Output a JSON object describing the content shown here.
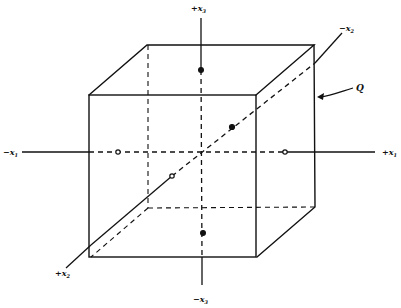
{
  "diagram": {
    "type": "cube-with-axes",
    "stroke_color": "#111111",
    "background": "#ffffff",
    "labels": {
      "plus_x3": {
        "sign": "+",
        "var": "x",
        "sub": "3"
      },
      "minus_x3": {
        "sign": "−",
        "var": "x",
        "sub": "3"
      },
      "minus_x1": {
        "sign": "−",
        "var": "x",
        "sub": "1"
      },
      "plus_x1": {
        "sign": "+",
        "var": "x",
        "sub": "1"
      },
      "plus_x2": {
        "sign": "+",
        "var": "x",
        "sub": "2"
      },
      "minus_x2": {
        "sign": "−",
        "var": "x",
        "sub": "2"
      },
      "cube": "Q"
    },
    "points": [
      {
        "id": "top",
        "x": 201,
        "y": 70,
        "filled": true
      },
      {
        "id": "bottom",
        "x": 203,
        "y": 233,
        "filled": true
      },
      {
        "id": "left",
        "x": 118,
        "y": 152,
        "filled": false
      },
      {
        "id": "right",
        "x": 285,
        "y": 152,
        "filled": false
      },
      {
        "id": "back",
        "x": 232,
        "y": 127,
        "filled": true
      },
      {
        "id": "front",
        "x": 172,
        "y": 176,
        "filled": false
      }
    ]
  }
}
